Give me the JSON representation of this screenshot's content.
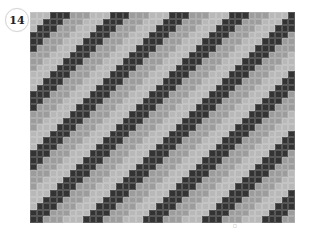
{
  "badge": {
    "number": "14"
  },
  "pattern": {
    "columns": 40,
    "rows": 32,
    "period": 9,
    "dark_offset": 3,
    "dark_width": 3,
    "mid_width": 3,
    "shift_per_row": -1,
    "colors": {
      "dark": "#333333",
      "mid": "#9c9c9c",
      "light": "#b8b8b8",
      "background": "#ffffff"
    }
  },
  "footer": {
    "page_mark": "□"
  }
}
